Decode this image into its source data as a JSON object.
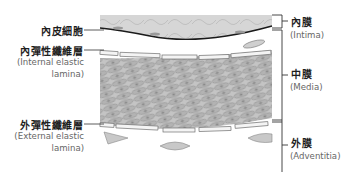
{
  "diagram": {
    "title": "",
    "left_labels": [
      {
        "id": "endothelial",
        "zh": "內皮細胞",
        "en_lines": []
      },
      {
        "id": "internal_elastic_lamina",
        "zh": "內彈性纖維層",
        "en_lines": [
          "(Internal elastic",
          "lamina)"
        ]
      },
      {
        "id": "external_elastic_lamina",
        "zh": "外彈性纖維層",
        "en_lines": [
          "(External elastic",
          "lamina)"
        ]
      }
    ],
    "right_labels": [
      {
        "id": "intima",
        "zh": "內膜",
        "en": "(Intima)"
      },
      {
        "id": "media",
        "zh": "中膜",
        "en": "(Media)"
      },
      {
        "id": "adventitia",
        "zh": "外膜",
        "en": "(Adventitia)"
      }
    ],
    "colors": {
      "tissue_gray": "#bdbdbd",
      "intima_gray": "#d2d2d2",
      "outline": "#555555",
      "endothelium_line": "#1a1a1a",
      "bracket": "#333333"
    }
  }
}
